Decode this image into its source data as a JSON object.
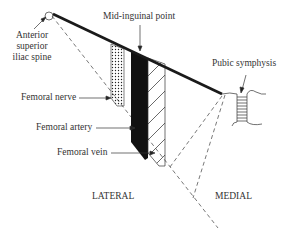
{
  "diagram": {
    "labels": {
      "asis_line1": "Anterior",
      "asis_line2": "superior",
      "asis_line3": "iliac spine",
      "mid_inguinal": "Mid-inguinal point",
      "pubic_symphysis": "Pubic symphysis",
      "femoral_nerve": "Femoral nerve",
      "femoral_artery": "Femoral artery",
      "femoral_vein": "Femoral vein",
      "lateral": "LATERAL",
      "medial": "MEDIAL"
    },
    "structures": [
      {
        "name": "Femoral nerve",
        "fill": "dotted",
        "order": 1
      },
      {
        "name": "Femoral artery",
        "fill": "solid black",
        "order": 2
      },
      {
        "name": "Femoral vein",
        "fill": "diagonal hatch",
        "order": 3
      }
    ],
    "colors": {
      "line": "#1a1a1a",
      "text": "#333333",
      "dashed": "#555555"
    }
  }
}
